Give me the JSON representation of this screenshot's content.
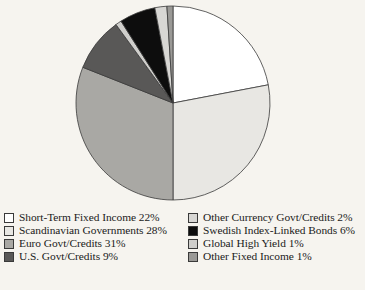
{
  "chart_data": {
    "type": "pie",
    "title": "",
    "subtitle": "",
    "xlabel": "",
    "ylabel": "",
    "grid": false,
    "legend_position": "bottom",
    "units": "percent",
    "start_angle_deg": 0,
    "direction": "clockwise",
    "categories": [
      "Short-Term Fixed Income",
      "Scandinavian Governments",
      "Euro Govt/Credits",
      "U.S. Govt/Credits",
      "Other Currency Govt/Credits",
      "Swedish Index-Linked Bonds",
      "Global High Yield",
      "Other Fixed Income"
    ],
    "values": [
      22,
      28,
      31,
      9,
      2,
      6,
      1,
      1
    ],
    "slice_order_clockwise_from_top": [
      "Short-Term Fixed Income",
      "Scandinavian Governments",
      "Euro Govt/Credits",
      "U.S. Govt/Credits",
      "Global High Yield",
      "Swedish Index-Linked Bonds",
      "Other Currency Govt/Credits",
      "Other Fixed Income"
    ],
    "colors": [
      "#ffffff",
      "#e8e7e3",
      "#a9a8a4",
      "#595857",
      "#cfcecb",
      "#0d0d0d",
      "#d8d7d4",
      "#9a9996"
    ],
    "slices": [
      {
        "label": "Short-Term Fixed Income",
        "value": 22,
        "color": "#ffffff"
      },
      {
        "label": "Scandinavian Governments",
        "value": 28,
        "color": "#e8e7e3"
      },
      {
        "label": "Euro Govt/Credits",
        "value": 31,
        "color": "#a9a8a4"
      },
      {
        "label": "U.S. Govt/Credits",
        "value": 9,
        "color": "#595857"
      },
      {
        "label": "Global High Yield",
        "value": 1,
        "color": "#cfcecb"
      },
      {
        "label": "Swedish Index-Linked Bonds",
        "value": 6,
        "color": "#0d0d0d"
      },
      {
        "label": "Other Currency Govt/Credits",
        "value": 2,
        "color": "#d8d7d4"
      },
      {
        "label": "Other Fixed Income",
        "value": 1,
        "color": "#9a9996"
      }
    ]
  },
  "pie": {
    "center_x": 173,
    "center_y": 103,
    "radius": 97,
    "stroke": "#3a3a3a",
    "stroke_width": 0.8
  },
  "legend": {
    "columns": [
      {
        "items": [
          {
            "label": "Short-Term Fixed Income 22%",
            "color": "#ffffff"
          },
          {
            "label": "Scandinavian Governments 28%",
            "color": "#e8e7e3"
          },
          {
            "label": "Euro Govt/Credits 31%",
            "color": "#a9a8a4"
          },
          {
            "label": "U.S. Govt/Credits 9%",
            "color": "#595857"
          }
        ]
      },
      {
        "items": [
          {
            "label": "Other Currency Govt/Credits 2%",
            "color": "#d8d7d4"
          },
          {
            "label": "Swedish Index-Linked Bonds 6%",
            "color": "#0d0d0d"
          },
          {
            "label": "Global High Yield 1%",
            "color": "#cfcecb"
          },
          {
            "label": "Other Fixed Income 1%",
            "color": "#9a9996"
          }
        ]
      }
    ]
  }
}
